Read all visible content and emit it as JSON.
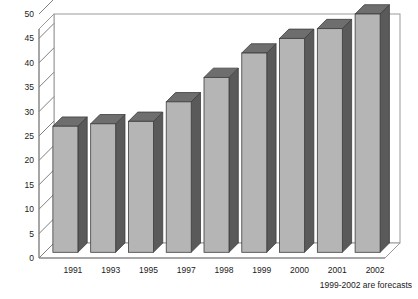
{
  "chart_data": {
    "type": "bar",
    "title": "",
    "subtitle": "",
    "xlabel": "",
    "ylabel": "",
    "categories": [
      "1991",
      "1993",
      "1995",
      "1997",
      "1998",
      "1999",
      "2000",
      "2001",
      "2002"
    ],
    "values": [
      27,
      27.5,
      28,
      32,
      37,
      42,
      45,
      47,
      50
    ],
    "series": [
      {
        "name": "",
        "values": [
          27,
          27.5,
          28,
          32,
          37,
          42,
          45,
          47,
          50
        ]
      }
    ],
    "ylim": [
      0,
      50
    ],
    "yticks": [
      0,
      5,
      10,
      15,
      20,
      25,
      30,
      35,
      40,
      45,
      50
    ],
    "ytick_labels": [
      "0",
      "5",
      "10",
      "15",
      "20",
      "25",
      "30",
      "35",
      "40",
      "45",
      "50"
    ],
    "grid": false,
    "legend": false,
    "legend_position": "none",
    "style": "3d-column",
    "annotations": [
      {
        "text": "1999-2002 are forecasts",
        "position": "below-axis-right"
      }
    ],
    "colors": {
      "bar_front": "#b5b5b5",
      "bar_side": "#5a5a5a",
      "bar_top": "#6e6e6e",
      "axis": "#808080",
      "frame": "#9a9a9a",
      "text": "#1a1a1a",
      "background": "#ffffff"
    }
  },
  "footnote": {
    "text": "1999-2002 are forecasts"
  }
}
